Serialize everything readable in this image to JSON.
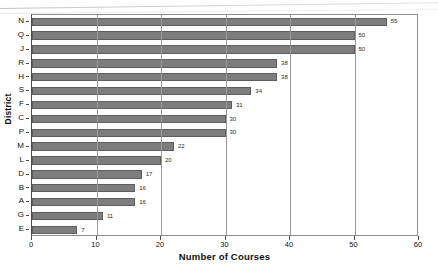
{
  "chart_data": {
    "type": "bar",
    "orientation": "horizontal",
    "title": "",
    "xlabel": "Number of Courses",
    "ylabel": "District",
    "xlim": [
      0,
      60
    ],
    "xticks": [
      0,
      10,
      20,
      30,
      40,
      50,
      60
    ],
    "grid": true,
    "grid_axis": "x",
    "legend": null,
    "bar_color": "#7d7d7d",
    "bar_edge_color": "#5e5e5e",
    "show_value_labels": true,
    "categories": [
      "N",
      "Q",
      "J",
      "R",
      "H",
      "S",
      "F",
      "C",
      "P",
      "M",
      "L",
      "D",
      "B",
      "A",
      "G",
      "E"
    ],
    "values": [
      55,
      50,
      50,
      38,
      38,
      34,
      31,
      30,
      30,
      22,
      20,
      17,
      16,
      16,
      11,
      7
    ],
    "points": [
      {
        "category": "N",
        "value": 55,
        "label": "55"
      },
      {
        "category": "Q",
        "value": 50,
        "label": "50"
      },
      {
        "category": "J",
        "value": 50,
        "label": "50"
      },
      {
        "category": "R",
        "value": 38,
        "label": "38"
      },
      {
        "category": "H",
        "value": 38,
        "label": "38"
      },
      {
        "category": "S",
        "value": 34,
        "label": "34"
      },
      {
        "category": "F",
        "value": 31,
        "label": "31"
      },
      {
        "category": "C",
        "value": 30,
        "label": "30"
      },
      {
        "category": "P",
        "value": 30,
        "label": "30"
      },
      {
        "category": "M",
        "value": 22,
        "label": "22"
      },
      {
        "category": "L",
        "value": 20,
        "label": "20"
      },
      {
        "category": "D",
        "value": 17,
        "label": "17"
      },
      {
        "category": "B",
        "value": 16,
        "label": "16"
      },
      {
        "category": "A",
        "value": 16,
        "label": "16"
      },
      {
        "category": "G",
        "value": 11,
        "label": "11"
      },
      {
        "category": "E",
        "value": 7,
        "label": "7"
      }
    ]
  }
}
